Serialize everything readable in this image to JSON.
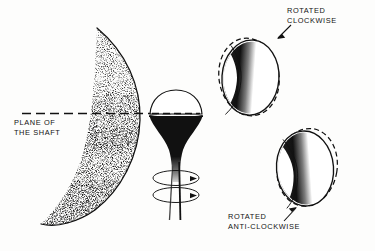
{
  "figure": {
    "background_color": "#fdfdfc",
    "ink_color": "#111111"
  },
  "labels": {
    "plane_line1": "PLANE OF",
    "plane_line2": "THE SHAFT",
    "clockwise_line1": "ROTATED",
    "clockwise_line2": "CLOCKWISE",
    "anticlockwise_line1": "ROTATED",
    "anticlockwise_line2": "ANTI-CLOCKWISE"
  },
  "elements": {
    "crescent_name": "stippled-crescent",
    "shaft_name": "trumpet-shaft",
    "ring_upper_name": "rotation-ring-upper",
    "ring_lower_name": "rotation-ring-lower",
    "ellipse_top_name": "rotated-clockwise-ellipse",
    "ellipse_bottom_name": "rotated-anticlockwise-ellipse",
    "plane_line_name": "plane-of-shaft-dashed-line"
  }
}
